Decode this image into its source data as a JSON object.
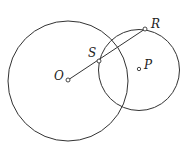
{
  "diagram": {
    "circles": [
      {
        "name": "circle-O",
        "cx": 68,
        "cy": 81,
        "r": 60
      },
      {
        "name": "circle-P",
        "cx": 139,
        "cy": 70,
        "r": 40.5
      }
    ],
    "segment": {
      "from": "O",
      "to": "R"
    },
    "points": {
      "O": {
        "label": "O",
        "x": 68,
        "y": 80
      },
      "S": {
        "label": "S",
        "x": 99,
        "y": 61
      },
      "R": {
        "label": "R",
        "x": 145,
        "y": 29
      },
      "P": {
        "label": "P",
        "x": 139,
        "y": 69
      }
    },
    "stroke_color": "#333333"
  }
}
